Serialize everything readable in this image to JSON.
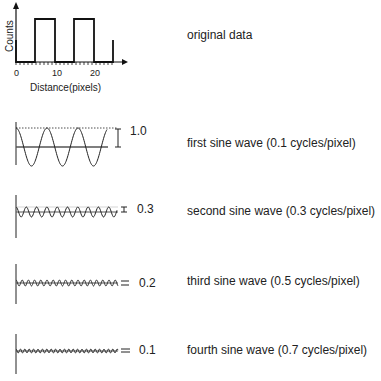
{
  "original": {
    "label": "original data",
    "ylabel": "Counts",
    "xlabel": "Distance(pixels)",
    "ticks": [
      "0",
      "10",
      "20"
    ]
  },
  "waves": [
    {
      "label": "first sine wave (0.1 cycles/pixel)",
      "amplitude": "1.0",
      "frequency": 0.1
    },
    {
      "label": "second sine wave (0.3 cycles/pixel)",
      "amplitude": "0.3",
      "frequency": 0.3
    },
    {
      "label": "third sine wave (0.5 cycles/pixel)",
      "amplitude": "0.2",
      "frequency": 0.5
    },
    {
      "label": "fourth sine wave (0.7 cycles/pixel)",
      "amplitude": "0.1",
      "frequency": 0.7
    }
  ],
  "chart_data": {
    "type": "line",
    "xlabel": "Distance(pixels)",
    "ylabel": "Counts",
    "x_ticks": [
      0,
      10,
      20
    ],
    "square_wave": {
      "high_intervals": [
        [
          5,
          10
        ],
        [
          15,
          20
        ]
      ],
      "edge_at": 25
    },
    "series": [
      {
        "name": "first sine wave",
        "frequency": 0.1,
        "amplitude": 1.0
      },
      {
        "name": "second sine wave",
        "frequency": 0.3,
        "amplitude": 0.3
      },
      {
        "name": "third sine wave",
        "frequency": 0.5,
        "amplitude": 0.2
      },
      {
        "name": "fourth sine wave",
        "frequency": 0.7,
        "amplitude": 0.1
      }
    ]
  }
}
